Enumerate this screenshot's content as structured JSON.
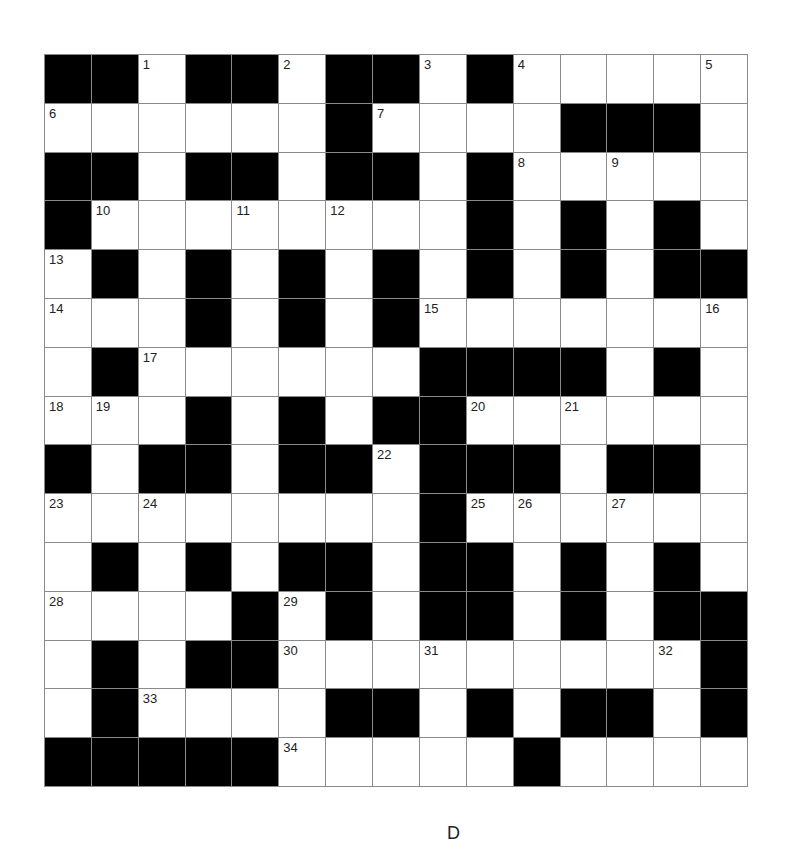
{
  "puzzle": {
    "type": "crossword",
    "rows": 15,
    "cols": 15,
    "colors": {
      "black": "#000000",
      "white": "#ffffff",
      "gridline": "#8a8a8a",
      "number": "#222222"
    },
    "layout": [
      "##.##.##.#.....",
      "......#....###.",
      "##.##.##.#.....",
      "#........#.#.#.",
      ".#.#.#.#.#.#.##",
      "...#.#.#.......",
      ".#......####.#.",
      "...#.#.##......",
      "#.##.##.###.##.",
      "........#......",
      ".#.#.##.##.#.#.",
      "....#.#.##.#.##",
      ".#.##.........#",
      ".#....##.#.##.#",
      "#####.....#...."
    ],
    "numbers": [
      {
        "n": "1",
        "r": 0,
        "c": 2
      },
      {
        "n": "2",
        "r": 0,
        "c": 5
      },
      {
        "n": "3",
        "r": 0,
        "c": 8
      },
      {
        "n": "4",
        "r": 0,
        "c": 10
      },
      {
        "n": "5",
        "r": 0,
        "c": 14
      },
      {
        "n": "6",
        "r": 1,
        "c": 0
      },
      {
        "n": "7",
        "r": 1,
        "c": 7
      },
      {
        "n": "8",
        "r": 2,
        "c": 10
      },
      {
        "n": "9",
        "r": 2,
        "c": 12
      },
      {
        "n": "10",
        "r": 3,
        "c": 1
      },
      {
        "n": "11",
        "r": 3,
        "c": 4
      },
      {
        "n": "12",
        "r": 3,
        "c": 6
      },
      {
        "n": "13",
        "r": 4,
        "c": 0
      },
      {
        "n": "14",
        "r": 5,
        "c": 0
      },
      {
        "n": "15",
        "r": 5,
        "c": 8
      },
      {
        "n": "16",
        "r": 5,
        "c": 14
      },
      {
        "n": "17",
        "r": 6,
        "c": 2
      },
      {
        "n": "18",
        "r": 7,
        "c": 0
      },
      {
        "n": "19",
        "r": 7,
        "c": 1
      },
      {
        "n": "20",
        "r": 7,
        "c": 9
      },
      {
        "n": "21",
        "r": 7,
        "c": 11
      },
      {
        "n": "22",
        "r": 8,
        "c": 7
      },
      {
        "n": "23",
        "r": 9,
        "c": 0
      },
      {
        "n": "24",
        "r": 9,
        "c": 2
      },
      {
        "n": "25",
        "r": 9,
        "c": 9
      },
      {
        "n": "26",
        "r": 9,
        "c": 10
      },
      {
        "n": "27",
        "r": 9,
        "c": 12
      },
      {
        "n": "28",
        "r": 11,
        "c": 0
      },
      {
        "n": "29",
        "r": 11,
        "c": 5
      },
      {
        "n": "30",
        "r": 12,
        "c": 5
      },
      {
        "n": "31",
        "r": 12,
        "c": 8
      },
      {
        "n": "32",
        "r": 12,
        "c": 13
      },
      {
        "n": "33",
        "r": 13,
        "c": 2
      },
      {
        "n": "34",
        "r": 14,
        "c": 5
      },
      {
        "n": "35",
        "r": 14,
        "c": 10
      }
    ]
  },
  "footer": {
    "glyph": "D"
  }
}
